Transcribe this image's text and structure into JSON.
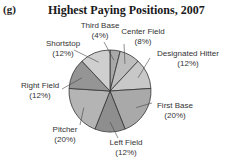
{
  "figure_label": "(g)",
  "chart_data": {
    "type": "pie",
    "title": "Highest Paying Positions, 2007",
    "slices": [
      {
        "label": "Third Base",
        "value": 4,
        "display": "(4%)",
        "color": "#a8a8a8"
      },
      {
        "label": "Center Field",
        "value": 8,
        "display": "(8%)",
        "color": "#bdbdbd"
      },
      {
        "label": "Designated Hitter",
        "value": 12,
        "display": "(12%)",
        "color": "#c8c8c8"
      },
      {
        "label": "First Base",
        "value": 20,
        "display": "(20%)",
        "color": "#a9a9a9"
      },
      {
        "label": "Left Field",
        "value": 12,
        "display": "(12%)",
        "color": "#8e8e8e"
      },
      {
        "label": "Pitcher",
        "value": 20,
        "display": "(20%)",
        "color": "#b4b4b4"
      },
      {
        "label": "Right Field",
        "value": 12,
        "display": "(12%)",
        "color": "#959595"
      },
      {
        "label": "Shortstop",
        "value": 12,
        "display": "(12%)",
        "color": "#cfcfcf"
      }
    ],
    "unit": "%",
    "start_angle": "top, clockwise"
  }
}
